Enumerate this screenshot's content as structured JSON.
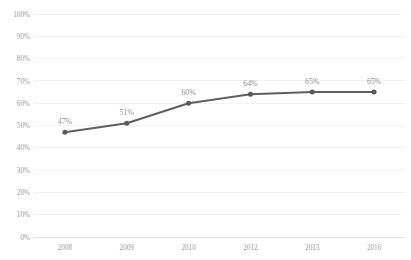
{
  "chart_data": {
    "type": "line",
    "title": "",
    "subtitle": "",
    "xlabel": "",
    "ylabel": "",
    "categories": [
      "2008",
      "2009",
      "2010",
      "2012",
      "2013",
      "2016"
    ],
    "values": [
      47,
      51,
      60,
      64,
      65,
      65
    ],
    "data_labels": [
      "47%",
      "51%",
      "60%",
      "64%",
      "65%",
      "65%"
    ],
    "series": [
      {
        "name": "",
        "values": [
          47,
          51,
          60,
          64,
          65,
          65
        ]
      }
    ],
    "ylim": [
      0,
      100
    ],
    "y_ticks": [
      0,
      10,
      20,
      30,
      40,
      50,
      60,
      70,
      80,
      90,
      100
    ],
    "y_tick_labels": [
      "0%",
      "10%",
      "20%",
      "30%",
      "40%",
      "50%",
      "60%",
      "70%",
      "80%",
      "90%",
      "100%"
    ],
    "x_tick_labels": [
      "2008",
      "2009",
      "2010",
      "2012",
      "2013",
      "2016"
    ],
    "grid": "horizontal",
    "legend": "none",
    "colors": {
      "line": "#5f5f5f",
      "marker": "#5a5a5a",
      "gridline": "#f0f0f0",
      "axis_text": "#9a9a9a",
      "data_label": "#8f8f8f",
      "background": "#ffffff"
    }
  },
  "plot": {
    "left": 34,
    "right": 405,
    "top": 14,
    "bottom": 237
  }
}
